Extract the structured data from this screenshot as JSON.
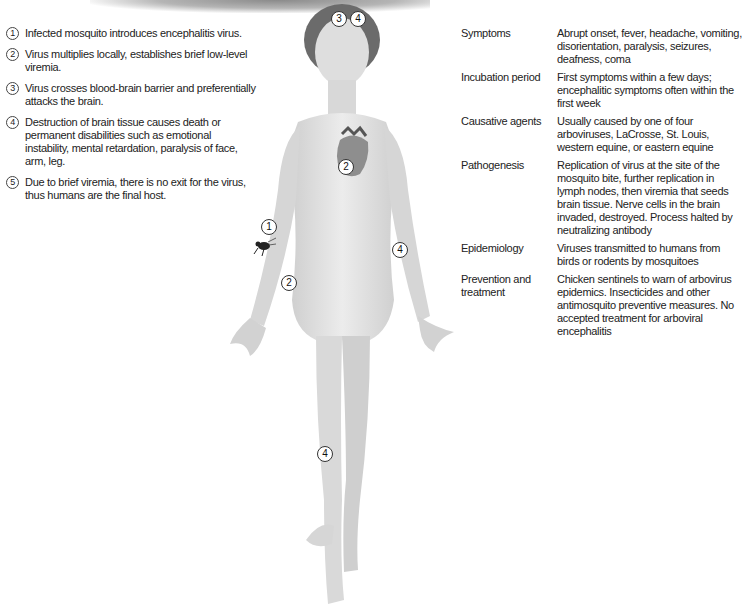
{
  "steps": [
    {
      "num": "1",
      "text": "Infected mosquito introduces encephalitis virus."
    },
    {
      "num": "2",
      "text": "Virus multiplies locally, establishes brief low-level viremia."
    },
    {
      "num": "3",
      "text": "Virus crosses blood-brain barrier and preferentially attacks the brain."
    },
    {
      "num": "4",
      "text": "Destruction of brain tissue causes death or permanent disabilities such as emotional instability, mental retardation, paralysis of face, arm, leg."
    },
    {
      "num": "5",
      "text": "Due to brief viremia, there is no exit for the virus, thus humans are the final host."
    }
  ],
  "figure": {
    "markers": [
      {
        "id": "head-left",
        "label": "3"
      },
      {
        "id": "head-right",
        "label": "4"
      },
      {
        "id": "heart",
        "label": "2"
      },
      {
        "id": "bite-site",
        "label": "1"
      },
      {
        "id": "right-forearm",
        "label": "2"
      },
      {
        "id": "left-forearm",
        "label": "4"
      },
      {
        "id": "leg",
        "label": "4"
      }
    ]
  },
  "facts": [
    {
      "key": "Symptoms",
      "value": "Abrupt onset, fever, headache, vomiting, disorientation, paralysis, seizures, deafness, coma"
    },
    {
      "key": "Incubation period",
      "value": "First symptoms within a few days; encephalitic symptoms often within the first week"
    },
    {
      "key": "Causative agents",
      "value": "Usually caused by one of four arboviruses, LaCrosse, St. Louis, western equine, or eastern equine"
    },
    {
      "key": "Pathogenesis",
      "value": "Replication of virus at the site of the mosquito bite, further replication in lymph nodes, then viremia that seeds brain tissue. Nerve cells in the brain invaded, destroyed. Process halted by neutralizing antibody"
    },
    {
      "key": "Epidemiology",
      "value": "Viruses transmitted to humans from birds or rodents by mosquitoes"
    },
    {
      "key": "Prevention and treatment",
      "value": "Chicken sentinels to warn of arbovirus epidemics. Insecticides and other antimosquito preventive measures. No accepted treatment for arboviral encephalitis"
    }
  ]
}
